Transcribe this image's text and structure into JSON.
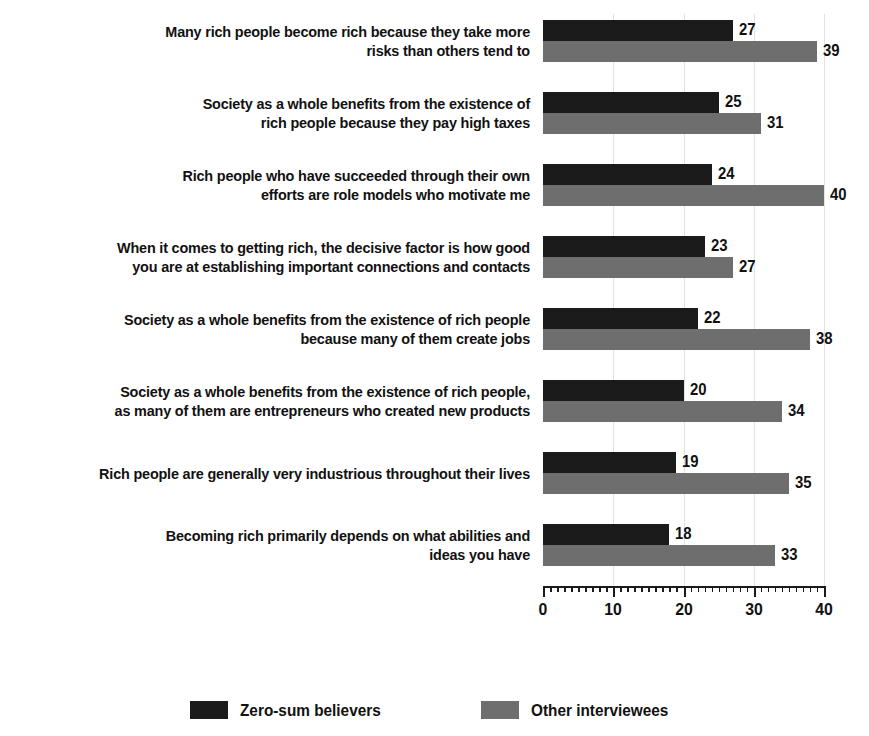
{
  "chart_data": {
    "type": "bar",
    "orientation": "horizontal",
    "title": "",
    "subtitle": "",
    "xlabel": "",
    "ylabel": "",
    "xlim": [
      0,
      40
    ],
    "grid": true,
    "grid_axis": "x",
    "legend_position": "bottom",
    "x_ticks_major": [
      0,
      10,
      20,
      30,
      40
    ],
    "x_tick_labels": [
      "0",
      "10",
      "20",
      "30",
      "40"
    ],
    "x_tick_minor_step": 1,
    "categories": [
      "Many rich people become rich because they take more\nrisks than others tend to",
      "Society as a whole benefits from the existence of\nrich people because they pay high taxes",
      "Rich people who have succeeded through their own\nefforts are role models who motivate me",
      "When it comes to getting rich, the decisive factor is how good\nyou are at establishing important connections and contacts",
      "Society as a whole benefits from the existence of rich people\nbecause many of them create jobs",
      "Society as a whole benefits from the existence of rich people,\nas many of them are entrepreneurs who created new products",
      "Rich people are generally very industrious throughout their lives",
      "Becoming rich primarily depends on what abilities and\nideas you have"
    ],
    "series": [
      {
        "name": "Zero-sum believers",
        "color": "#1b1b1b",
        "values": [
          27,
          25,
          24,
          23,
          22,
          20,
          19,
          18
        ]
      },
      {
        "name": "Other interviewees",
        "color": "#6e6e6e",
        "values": [
          39,
          31,
          40,
          27,
          38,
          34,
          35,
          33
        ]
      }
    ]
  },
  "legend": {
    "items": [
      {
        "label": "Zero-sum believers",
        "color": "#1b1b1b"
      },
      {
        "label": "Other interviewees",
        "color": "#6e6e6e"
      }
    ]
  },
  "colors": {
    "primary": "#1b1b1b",
    "secondary": "#6e6e6e",
    "gridline": "#e2e2e2",
    "text": "#111111",
    "background": "#ffffff"
  }
}
